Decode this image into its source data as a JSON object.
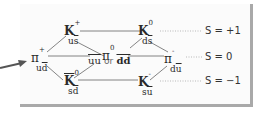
{
  "diagram": {
    "nodes": {
      "k_plus": {
        "symbol": "K",
        "charge": "+",
        "quark_a": "u",
        "quark_b": "s"
      },
      "k_zero": {
        "symbol": "K",
        "charge": "0",
        "quark_a": "d",
        "quark_b": "s"
      },
      "pi_plus": {
        "symbol": "π",
        "charge": "+",
        "quark_a": "u",
        "quark_b": "d"
      },
      "pi_zero": {
        "symbol": "π",
        "charge": "0",
        "left": "uu",
        "or": "or",
        "right": "dd"
      },
      "pi_minus": {
        "symbol": "π",
        "charge": "-",
        "quark_a": "d",
        "quark_b": "u"
      },
      "kbar_zero": {
        "symbol": "K",
        "charge": "0",
        "quark_a": "s",
        "quark_b": "d"
      },
      "k_minus": {
        "symbol": "K",
        "charge": "-",
        "quark_a": "s",
        "quark_b": "u"
      }
    },
    "strangeness_labels": [
      "S = +1",
      "S = 0",
      "S = −1"
    ],
    "colors": {
      "line": "#555555",
      "dotted": "#aaaaaa",
      "arrow": "#555555",
      "panel_border": "#a9a9a9"
    }
  }
}
